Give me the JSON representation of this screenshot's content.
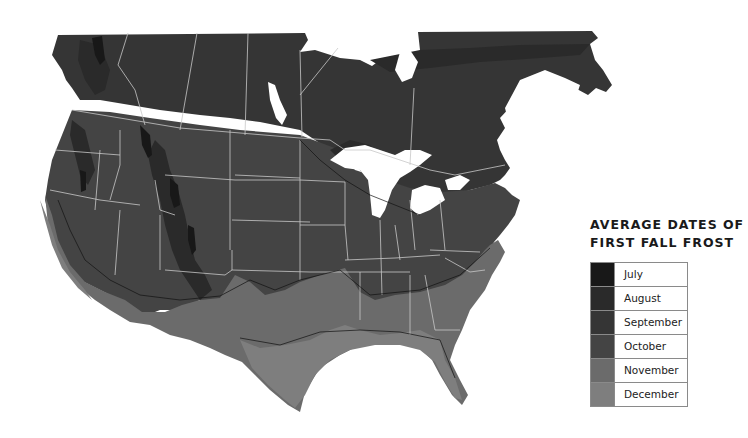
{
  "legend": {
    "title_line1": "AVERAGE DATES OF",
    "title_line2": "FIRST FALL FROST",
    "items": [
      {
        "label": "July",
        "color": "#181818"
      },
      {
        "label": "August",
        "color": "#2a2a2a"
      },
      {
        "label": "September",
        "color": "#353535"
      },
      {
        "label": "October",
        "color": "#444444"
      },
      {
        "label": "November",
        "color": "#6b6b6b"
      },
      {
        "label": "December",
        "color": "#7e7e7e"
      }
    ]
  },
  "map": {
    "region": "United States and Southern Canada",
    "water_color": "#ffffff",
    "border_color": "#c8c8c8",
    "contour_color": "#111111"
  }
}
